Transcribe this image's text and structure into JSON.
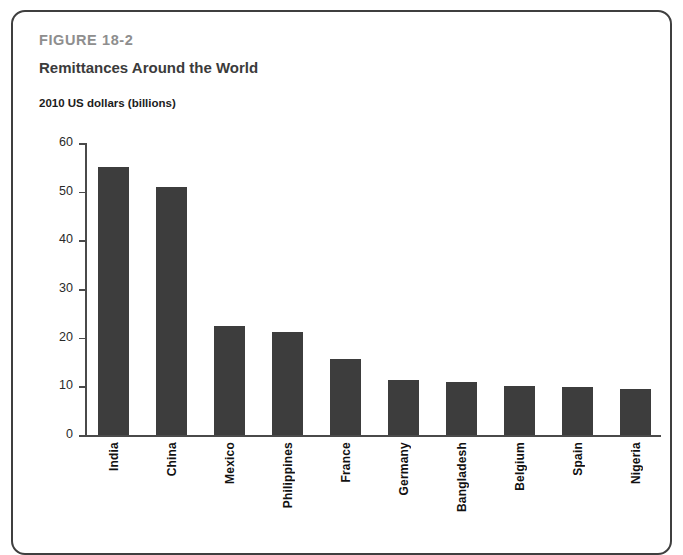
{
  "figure": {
    "label": "FIGURE 18-2",
    "title": "Remittances Around the World"
  },
  "colors": {
    "bar": "#3d3d3d",
    "axis": "#4a4a4a",
    "frame": "#3f3f3f",
    "figure_label": "#8e8e8e",
    "title": "#3b3b3b"
  },
  "chart_data": {
    "type": "bar",
    "title": "Remittances Around the World",
    "subtitle": "FIGURE 18-2",
    "xlabel": "",
    "ylabel": "2010 US dollars (billions)",
    "ylim": [
      0,
      60
    ],
    "yticks": [
      0,
      10,
      20,
      30,
      40,
      50,
      60
    ],
    "ytick_labels": [
      "0",
      "10",
      "20",
      "30",
      "40",
      "50",
      "60"
    ],
    "grid": false,
    "legend": false,
    "categories": [
      "India",
      "China",
      "Mexico",
      "Philippines",
      "France",
      "Germany",
      "Bangladesh",
      "Belgium",
      "Spain",
      "Nigeria"
    ],
    "values": [
      55.0,
      51.0,
      22.5,
      21.2,
      15.6,
      11.3,
      10.8,
      10.1,
      9.8,
      9.5
    ]
  }
}
